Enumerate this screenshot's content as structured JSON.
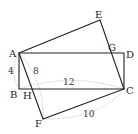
{
  "diagram": {
    "type": "geometry",
    "points": {
      "A": {
        "label": "A",
        "x": 19,
        "y": 53
      },
      "B": {
        "label": "B",
        "x": 19,
        "y": 89
      },
      "C": {
        "label": "C",
        "x": 124,
        "y": 89
      },
      "D": {
        "label": "D",
        "x": 124,
        "y": 53
      },
      "E": {
        "label": "E",
        "x": 100,
        "y": 20
      },
      "F": {
        "label": "F",
        "x": 43,
        "y": 119
      },
      "G": {
        "label": "G",
        "x": 111,
        "y": 53
      },
      "H": {
        "label": "H",
        "x": 30,
        "y": 89
      }
    },
    "labels": {
      "A": "A",
      "B": "B",
      "C": "C",
      "D": "D",
      "E": "E",
      "F": "F",
      "G": "G",
      "H": "H"
    },
    "measurements": {
      "AB": "4",
      "AF": "8",
      "AC": "12",
      "FC": "10"
    },
    "shapes": [
      {
        "name": "rectangle-ABCD",
        "vertices": [
          "A",
          "B",
          "C",
          "D"
        ]
      },
      {
        "name": "rectangle-AECF",
        "vertices": [
          "A",
          "E",
          "C",
          "F"
        ]
      }
    ],
    "colors": {
      "line": "#222222",
      "dotted": "#aaaaaa"
    }
  }
}
